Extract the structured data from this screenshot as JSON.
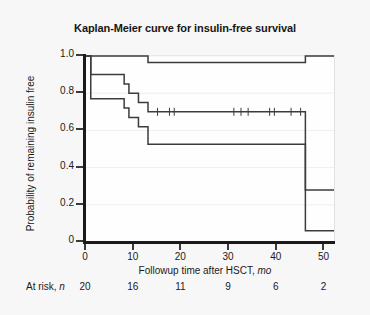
{
  "figure": {
    "title": "Kaplan-Meier curve for insulin-free survival",
    "background_color": "#f7f7f7",
    "plot_background_color": "#fefefe",
    "axis_color": "#1a1a1a",
    "curve_color": "#3c3c3c",
    "grid_color": "#efefef"
  },
  "at_risk": {
    "label_prefix": "At risk, ",
    "label_symbol": "n",
    "times": [
      0,
      10,
      20,
      30,
      40,
      50
    ],
    "values": [
      "20",
      "16",
      "11",
      "9",
      "6",
      "2"
    ]
  },
  "chart_data": {
    "type": "line",
    "title": "Kaplan-Meier curve for insulin-free survival",
    "xlabel": "Followup time after HSCT, mo",
    "xlabel_text": "Followup time after HSCT, ",
    "xlabel_unit": "mo",
    "ylabel": "Probability of remaining insulin free",
    "xlim": [
      0,
      52
    ],
    "ylim": [
      0,
      1.0
    ],
    "xticks": [
      0,
      10,
      20,
      30,
      40,
      50
    ],
    "xticklabels": [
      "0",
      "10",
      "20",
      "30",
      "40",
      "50"
    ],
    "yticks": [
      0,
      0.2,
      0.4,
      0.6,
      0.8,
      1.0
    ],
    "yticklabels": [
      "0",
      "0.2",
      "0.4",
      "0.6",
      "0.8",
      "1.0"
    ],
    "grid": "horizontal",
    "legend": "none",
    "step_type": "post",
    "series": [
      {
        "name": "Upper 95% confidence limit",
        "role": "upper-ci",
        "x": [
          0,
          1,
          9,
          13,
          42,
          46,
          52
        ],
        "y": [
          1.0,
          1.0,
          1.0,
          0.965,
          0.965,
          1.0,
          1.0
        ]
      },
      {
        "name": "Kaplan-Meier estimate",
        "role": "estimate",
        "x": [
          0,
          1,
          4,
          8,
          9,
          11,
          13,
          42,
          46,
          52
        ],
        "y": [
          1.0,
          0.9,
          0.9,
          0.85,
          0.8,
          0.75,
          0.7,
          0.7,
          0.28,
          0.28
        ],
        "censor_times": [
          15,
          17.5,
          18.5,
          31,
          32.5,
          34,
          38.5,
          39.5,
          43,
          45
        ]
      },
      {
        "name": "Lower 95% confidence limit",
        "role": "lower-ci",
        "x": [
          0,
          1,
          4,
          8,
          9,
          11,
          13,
          42,
          46,
          52
        ],
        "y": [
          1.0,
          0.77,
          0.77,
          0.72,
          0.67,
          0.62,
          0.525,
          0.525,
          0.06,
          0.06
        ]
      }
    ]
  }
}
